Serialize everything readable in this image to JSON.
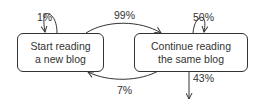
{
  "diagram": {
    "type": "state-transition",
    "nodes": [
      {
        "id": "new",
        "lines": [
          "Start reading",
          "a new blog"
        ]
      },
      {
        "id": "same",
        "lines": [
          "Continue reading",
          "the same blog"
        ]
      }
    ],
    "edges": [
      {
        "from": "new",
        "to": "new",
        "label": "1%"
      },
      {
        "from": "new",
        "to": "same",
        "label": "99%"
      },
      {
        "from": "same",
        "to": "same",
        "label": "50%"
      },
      {
        "from": "same",
        "to": "new",
        "label": "7%"
      },
      {
        "from": "same",
        "to": "exit",
        "label": "43%"
      }
    ],
    "colors": {
      "stroke": "#333333",
      "text": "#333333",
      "background": "#ffffff"
    }
  }
}
